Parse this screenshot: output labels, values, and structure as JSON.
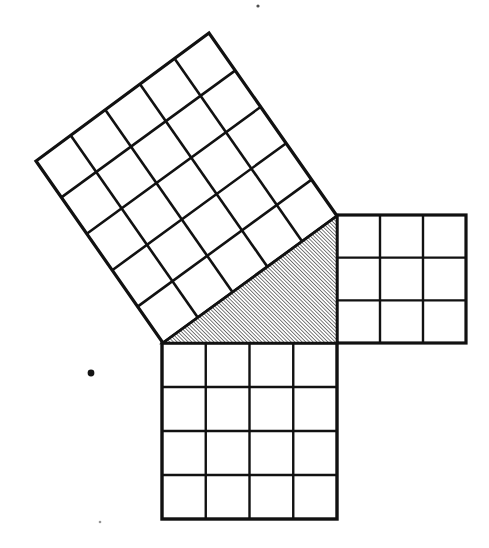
{
  "figure": {
    "title": "Pythagorean theorem square-on-each-side diagram",
    "background_color": "#ffffff",
    "ink_color": "#111111",
    "canvas": {
      "width": 489,
      "height": 548
    },
    "triangle": {
      "name": "right-triangle",
      "fill_style": "diagonal-hatch",
      "hatch_angle_deg": 45,
      "hatch_spacing_px": 2.6,
      "hatch_stroke_width": 1.1,
      "stroke_width": 2.6,
      "right_angle_at": "vertex-c",
      "vertices": [
        {
          "label": "A",
          "x": 163,
          "y": 343
        },
        {
          "label": "B",
          "x": 337,
          "y": 216
        },
        {
          "label": "C",
          "x": 337,
          "y": 343
        }
      ],
      "side_lengths_units": {
        "a": 3,
        "b": 4,
        "c": 5
      }
    },
    "squares": [
      {
        "name": "square-on-hypotenuse",
        "units_per_side": 5,
        "cell_count": 25,
        "orientation": "tilted",
        "stroke_width_outer": 3.2,
        "stroke_width_grid": 2.6,
        "corners": [
          {
            "x": 163,
            "y": 343
          },
          {
            "x": 337,
            "y": 216
          },
          {
            "x": 209,
            "y": 33
          },
          {
            "x": 36,
            "y": 161
          }
        ]
      },
      {
        "name": "square-on-vertical-leg",
        "units_per_side": 3,
        "cell_count": 9,
        "orientation": "axis-aligned",
        "stroke_width_outer": 3.2,
        "stroke_width_grid": 2.4,
        "corners": [
          {
            "x": 337,
            "y": 215
          },
          {
            "x": 466,
            "y": 215
          },
          {
            "x": 466,
            "y": 343
          },
          {
            "x": 337,
            "y": 343
          }
        ]
      },
      {
        "name": "square-on-horizontal-leg",
        "units_per_side": 4,
        "cell_count": 16,
        "orientation": "axis-aligned",
        "stroke_width_outer": 3.4,
        "stroke_width_grid": 2.4,
        "corners": [
          {
            "x": 162,
            "y": 343
          },
          {
            "x": 337,
            "y": 343
          },
          {
            "x": 337,
            "y": 519
          },
          {
            "x": 162,
            "y": 519
          }
        ]
      }
    ],
    "specks": [
      {
        "name": "speck-left",
        "x": 91,
        "y": 373,
        "r": 3.4,
        "opacity": 1
      },
      {
        "name": "speck-top",
        "x": 258,
        "y": 6,
        "r": 1.6,
        "opacity": 0.75
      },
      {
        "name": "speck-bottom",
        "x": 100,
        "y": 522,
        "r": 1.3,
        "opacity": 0.45
      }
    ]
  }
}
